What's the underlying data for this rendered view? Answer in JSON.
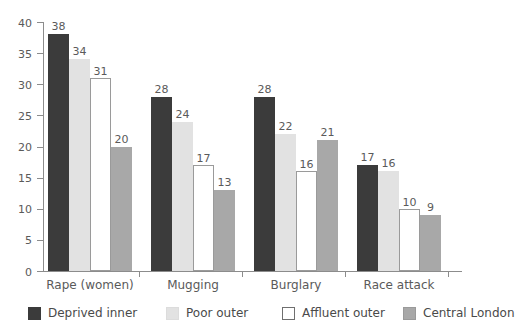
{
  "chart_data": {
    "type": "bar",
    "title": "",
    "subtitle": "",
    "xlabel": "",
    "ylabel": "",
    "ylim": [
      0,
      40
    ],
    "yticks": [
      0,
      5,
      10,
      15,
      20,
      25,
      30,
      35,
      40
    ],
    "ytick_labels": [
      "0",
      "5",
      "10",
      "15",
      "20",
      "25",
      "30",
      "35",
      "40"
    ],
    "grid": false,
    "legend_position": "bottom",
    "data_labels": true,
    "categories": [
      "Rape (women)",
      "Mugging",
      "Burglary",
      "Race attack"
    ],
    "series": [
      {
        "name": "Deprived inner",
        "color": "#3b3b3b",
        "values": [
          38,
          28,
          28,
          17
        ]
      },
      {
        "name": "Poor outer",
        "color": "#e2e2e2",
        "values": [
          34,
          24,
          22,
          16
        ]
      },
      {
        "name": "Affluent outer",
        "color": "#ffffff",
        "values": [
          31,
          17,
          16,
          10
        ]
      },
      {
        "name": "Central London",
        "color": "#a8a8a8",
        "values": [
          20,
          13,
          21,
          9
        ]
      }
    ]
  },
  "axis": {
    "y_tick_labels": [
      "40",
      "35",
      "30",
      "25",
      "20",
      "15",
      "10",
      "5",
      "0"
    ]
  },
  "legend": {
    "items": [
      {
        "label": "Deprived inner"
      },
      {
        "label": "Poor outer"
      },
      {
        "label": "Affluent outer"
      },
      {
        "label": "Central London"
      }
    ]
  },
  "groups": [
    {
      "label": "Rape (women)"
    },
    {
      "label": "Mugging"
    },
    {
      "label": "Burglary"
    },
    {
      "label": "Race attack"
    }
  ]
}
